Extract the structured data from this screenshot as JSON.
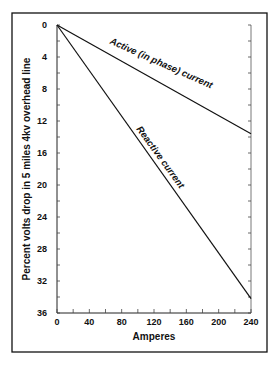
{
  "chart_data": {
    "type": "line",
    "title": "",
    "xlabel": "Amperes",
    "ylabel": "Percent volts drop in 5 miles 4kv overhead line",
    "xlim": [
      0,
      240
    ],
    "ylim": [
      0,
      36
    ],
    "y_inverted": true,
    "x_ticks": [
      0,
      40,
      80,
      120,
      160,
      200,
      240
    ],
    "y_ticks": [
      0,
      4,
      8,
      12,
      16,
      20,
      24,
      28,
      32,
      36
    ],
    "grid": false,
    "series": [
      {
        "name": "Active (in phase) current",
        "x": [
          0,
          240
        ],
        "y": [
          0,
          13.6
        ]
      },
      {
        "name": "Reactive current",
        "x": [
          0,
          240
        ],
        "y": [
          0,
          34.2
        ]
      }
    ],
    "annotations": [
      "Active (in phase) current",
      "Reactive current"
    ]
  }
}
